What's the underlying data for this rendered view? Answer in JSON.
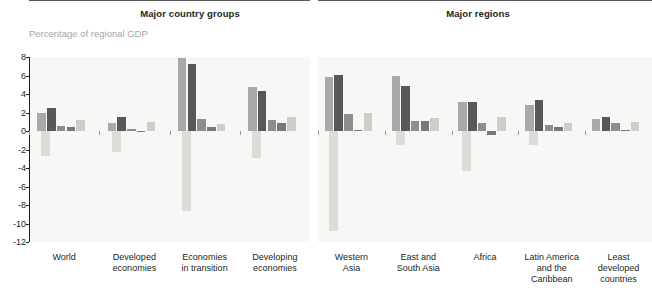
{
  "panels": [
    {
      "title": "Major country groups"
    },
    {
      "title": "Major regions"
    }
  ],
  "axis_caption": "Percentage of regional GDP",
  "chart_data": {
    "type": "bar",
    "title": "Percentage of regional GDP",
    "subtitle": "",
    "xlabel": "",
    "ylabel": "Percentage of regional GDP",
    "ylim": [
      -12,
      8
    ],
    "yticks": [
      8,
      6,
      4,
      2,
      0,
      -2,
      -4,
      -6,
      -8,
      -10,
      -12
    ],
    "ytick_labels": [
      "8",
      "6",
      "4",
      "2",
      "0",
      "-2",
      "-4",
      "-6",
      "-8",
      "-10",
      "-12"
    ],
    "grid": false,
    "legend": "none",
    "panels": [
      {
        "name": "Major country groups",
        "categories": [
          "World",
          "Developed\neconomies",
          "Economies\nin transition",
          "Developing\neconomies"
        ],
        "series": [
          {
            "name": "bar-1",
            "color": "#a9a9a7",
            "values": [
              1.9,
              0.9,
              7.9,
              4.8
            ]
          },
          {
            "name": "bar-2",
            "color": "#58585a",
            "values": [
              2.5,
              1.5,
              7.2,
              4.3
            ]
          },
          {
            "name": "bar-3",
            "color": "#8e8e8c",
            "values": [
              0.55,
              0.2,
              1.3,
              1.15
            ]
          },
          {
            "name": "bar-4",
            "color": "#787878",
            "values": [
              0.45,
              0.0,
              0.45,
              0.85
            ]
          },
          {
            "name": "bar-5",
            "color": "#cdcdc9",
            "values": [
              1.2,
              1.0,
              0.75,
              1.55
            ]
          },
          {
            "name": "bar-negative",
            "color": "#dcdcd8",
            "values": [
              -2.7,
              -2.3,
              -8.6,
              -2.9
            ]
          }
        ]
      },
      {
        "name": "Major regions",
        "categories": [
          "Western\nAsia",
          "East and\nSouth Asia",
          "Africa",
          "Latin America\nand the\nCaribbean",
          "Least\ndeveloped\ncountries"
        ],
        "series": [
          {
            "name": "bar-1",
            "color": "#a9a9a7",
            "values": [
              5.8,
              5.9,
              3.1,
              2.8,
              1.3
            ]
          },
          {
            "name": "bar-2",
            "color": "#58585a",
            "values": [
              6.1,
              4.9,
              3.1,
              3.3,
              1.5
            ]
          },
          {
            "name": "bar-3",
            "color": "#8e8e8c",
            "values": [
              1.8,
              1.1,
              0.85,
              0.6,
              0.85
            ]
          },
          {
            "name": "bar-4",
            "color": "#787878",
            "values": [
              0.1,
              1.05,
              -0.4,
              0.4,
              0.15
            ]
          },
          {
            "name": "bar-5",
            "color": "#cdcdc9",
            "values": [
              1.9,
              1.45,
              1.5,
              0.9,
              1.0
            ]
          },
          {
            "name": "bar-negative",
            "color": "#dcdcd8",
            "values": [
              -10.8,
              -1.5,
              -4.3,
              -1.5,
              0.0
            ]
          }
        ]
      }
    ]
  },
  "colors": {
    "background": "#ffffff",
    "plot_background": "#f7f7f5",
    "axis": "#231f20",
    "caption": "#a6a6a6",
    "bar_1": "#a9a9a7",
    "bar_2": "#58585a",
    "bar_3": "#8e8e8c",
    "bar_4": "#787878",
    "bar_5": "#cdcdc9",
    "bar_negative": "#dcdcd8"
  }
}
